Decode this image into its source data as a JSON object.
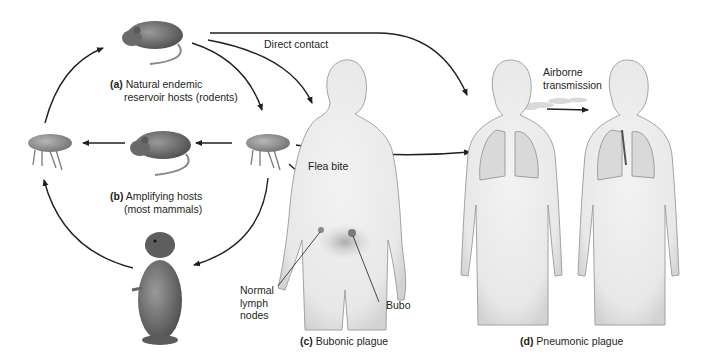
{
  "diagram": {
    "labels": {
      "a_tag": "(a)",
      "a_line1": "Natural endemic",
      "a_line2": "reservoir hosts (rodents)",
      "b_tag": "(b)",
      "b_line1": "Amplifying hosts",
      "b_line2": "(most mammals)",
      "c_tag": "(c)",
      "c_text": "Bubonic plague",
      "d_tag": "(d)",
      "d_text": "Pneumonic plague",
      "direct_contact": "Direct contact",
      "flea_bite": "Flea bite",
      "airborne_1": "Airborne",
      "airborne_2": "transmission",
      "normal_1": "Normal",
      "normal_2": "lymph",
      "normal_3": "nodes",
      "bubo": "Bubo"
    },
    "nodes": [
      {
        "id": "rat-reservoir",
        "icon": "rat-icon"
      },
      {
        "id": "flea-left",
        "icon": "flea-icon"
      },
      {
        "id": "rat-amplifying",
        "icon": "rat-icon"
      },
      {
        "id": "flea-right",
        "icon": "flea-icon"
      },
      {
        "id": "prairie-dog",
        "icon": "prairie-dog-icon"
      },
      {
        "id": "human-bubonic",
        "icon": "human-body-icon"
      },
      {
        "id": "human-pneumonic-source",
        "icon": "human-lungs-icon"
      },
      {
        "id": "human-pneumonic-target",
        "icon": "human-lungs-icon"
      }
    ],
    "colors": {
      "text": "#231f20",
      "arrow": "#231f20",
      "body_fill": "#ececec",
      "body_stroke": "#9a9a9a",
      "animal": "#6f6f6f"
    }
  }
}
